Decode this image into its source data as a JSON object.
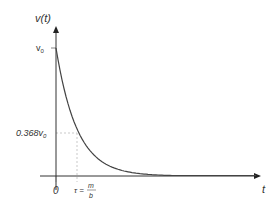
{
  "chart_data": {
    "type": "line",
    "title": "",
    "xlabel": "t",
    "ylabel": "v(t)",
    "function": "v(t) = v0 * exp(-t/tau)",
    "series": [
      {
        "name": "v(t)",
        "x": [
          0,
          0.25,
          0.5,
          0.75,
          1,
          1.5,
          2,
          3,
          4,
          5,
          6,
          7,
          8
        ],
        "y": [
          1,
          0.779,
          0.607,
          0.472,
          0.368,
          0.223,
          0.135,
          0.05,
          0.018,
          0.007,
          0.002,
          0.001,
          0.0003
        ]
      }
    ],
    "x_unit": "tau",
    "y_unit": "v0",
    "ytick_labels": [
      "v0",
      "0.368v0"
    ],
    "xtick_labels": [
      "0",
      "τ = m/b"
    ],
    "annotations": [
      {
        "text": "0.368v0",
        "x": 0,
        "y": 0.368
      },
      {
        "text": "τ = m/b",
        "x": 1,
        "y": 0
      }
    ],
    "grid": false,
    "legend": null
  },
  "labels": {
    "y_axis": "v(t)",
    "x_axis": "t",
    "v0_base": "v",
    "v0_sub": "0",
    "mid_base": "0.368v",
    "mid_sub": "0",
    "origin": "0",
    "tau_lhs": "τ =",
    "tau_num": "m",
    "tau_den": "b"
  },
  "colors": {
    "curve": "#444444",
    "axis": "#333333",
    "guide": "#bbbbbb"
  }
}
